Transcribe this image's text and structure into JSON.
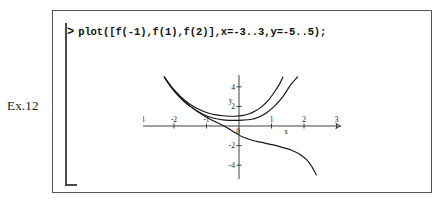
{
  "exercise": {
    "label": "Ex.12"
  },
  "worksheet": {
    "prompt": ">",
    "command": "plot([f(-1),f(1),f(2)],x=-3..3,y=-5..5);"
  },
  "chart_data": {
    "type": "line",
    "title": "",
    "xlabel": "x",
    "ylabel": "y",
    "xlim": [
      -3,
      3
    ],
    "ylim": [
      -5,
      5
    ],
    "grid": false,
    "legend": null,
    "xticks": [
      -3,
      -2,
      -1,
      0,
      1,
      2,
      3
    ],
    "xtick_labels": [
      "-3",
      "-2",
      "-1",
      "0",
      "1",
      "2",
      "3"
    ],
    "yticks": [
      4,
      2,
      -2,
      -4
    ],
    "ytick_labels": [
      "4",
      "2",
      "-2",
      "-4"
    ],
    "origin_label": "0",
    "series": [
      {
        "name": "f(-1)",
        "comment": "upper parabola-like branch, minimum near x=-0.2",
        "x": [
          -2.3,
          -2.1,
          -1.9,
          -1.7,
          -1.5,
          -1.3,
          -1.1,
          -0.9,
          -0.7,
          -0.5,
          -0.3,
          -0.1,
          0.1,
          0.3,
          0.5,
          0.7,
          0.9,
          1.1,
          1.25,
          1.35
        ],
        "y": [
          5.0,
          4.1,
          3.35,
          2.7,
          2.2,
          1.8,
          1.5,
          1.28,
          1.14,
          1.05,
          1.0,
          1.0,
          1.06,
          1.22,
          1.52,
          1.98,
          2.62,
          3.52,
          4.3,
          5.0
        ]
      },
      {
        "name": "f(1)",
        "comment": "lower parabola-like branch, minimum near x=0.35",
        "x": [
          -2.3,
          -2.1,
          -1.9,
          -1.7,
          -1.5,
          -1.3,
          -1.1,
          -0.9,
          -0.7,
          -0.5,
          -0.3,
          -0.1,
          0.1,
          0.35,
          0.6,
          0.85,
          1.1,
          1.35,
          1.6,
          1.8
        ],
        "y": [
          5.0,
          4.05,
          3.25,
          2.55,
          2.0,
          1.55,
          1.18,
          0.92,
          0.74,
          0.63,
          0.58,
          0.57,
          0.6,
          0.66,
          0.9,
          1.35,
          2.05,
          3.0,
          4.25,
          5.0
        ]
      },
      {
        "name": "f(2)",
        "comment": "monotone decreasing branch crossing y-axis near -0.9, steep fall past x=2",
        "x": [
          -2.3,
          -2.1,
          -1.9,
          -1.7,
          -1.5,
          -1.3,
          -1.1,
          -0.9,
          -0.7,
          -0.5,
          -0.3,
          -0.1,
          0.1,
          0.4,
          0.8,
          1.2,
          1.6,
          1.9,
          2.1,
          2.25,
          2.38
        ],
        "y": [
          5.0,
          4.0,
          3.2,
          2.55,
          2.0,
          1.52,
          1.1,
          0.72,
          0.38,
          0.06,
          -0.3,
          -0.72,
          -1.1,
          -1.45,
          -1.75,
          -2.05,
          -2.45,
          -2.95,
          -3.5,
          -4.2,
          -5.0
        ]
      }
    ]
  }
}
